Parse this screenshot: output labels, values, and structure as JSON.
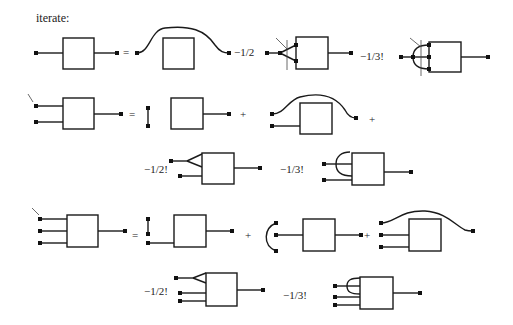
{
  "title": "iterate:",
  "rows": {
    "row1": {
      "eq": "=",
      "coef1": "−1/2",
      "coef2": "−1/3!"
    },
    "row2": {
      "eq": "=",
      "plus1": "+",
      "plus2": "+"
    },
    "row3": {
      "coef1": "−1/2!",
      "coef2": "−1/3!"
    },
    "row4": {
      "eq": "=",
      "plus1": "+",
      "plus2": "+"
    },
    "row5": {
      "coef1": "−1/2!",
      "coef2": "−1/3!"
    }
  },
  "colors": {
    "stroke": "#1a1a1a",
    "background": "#ffffff"
  }
}
